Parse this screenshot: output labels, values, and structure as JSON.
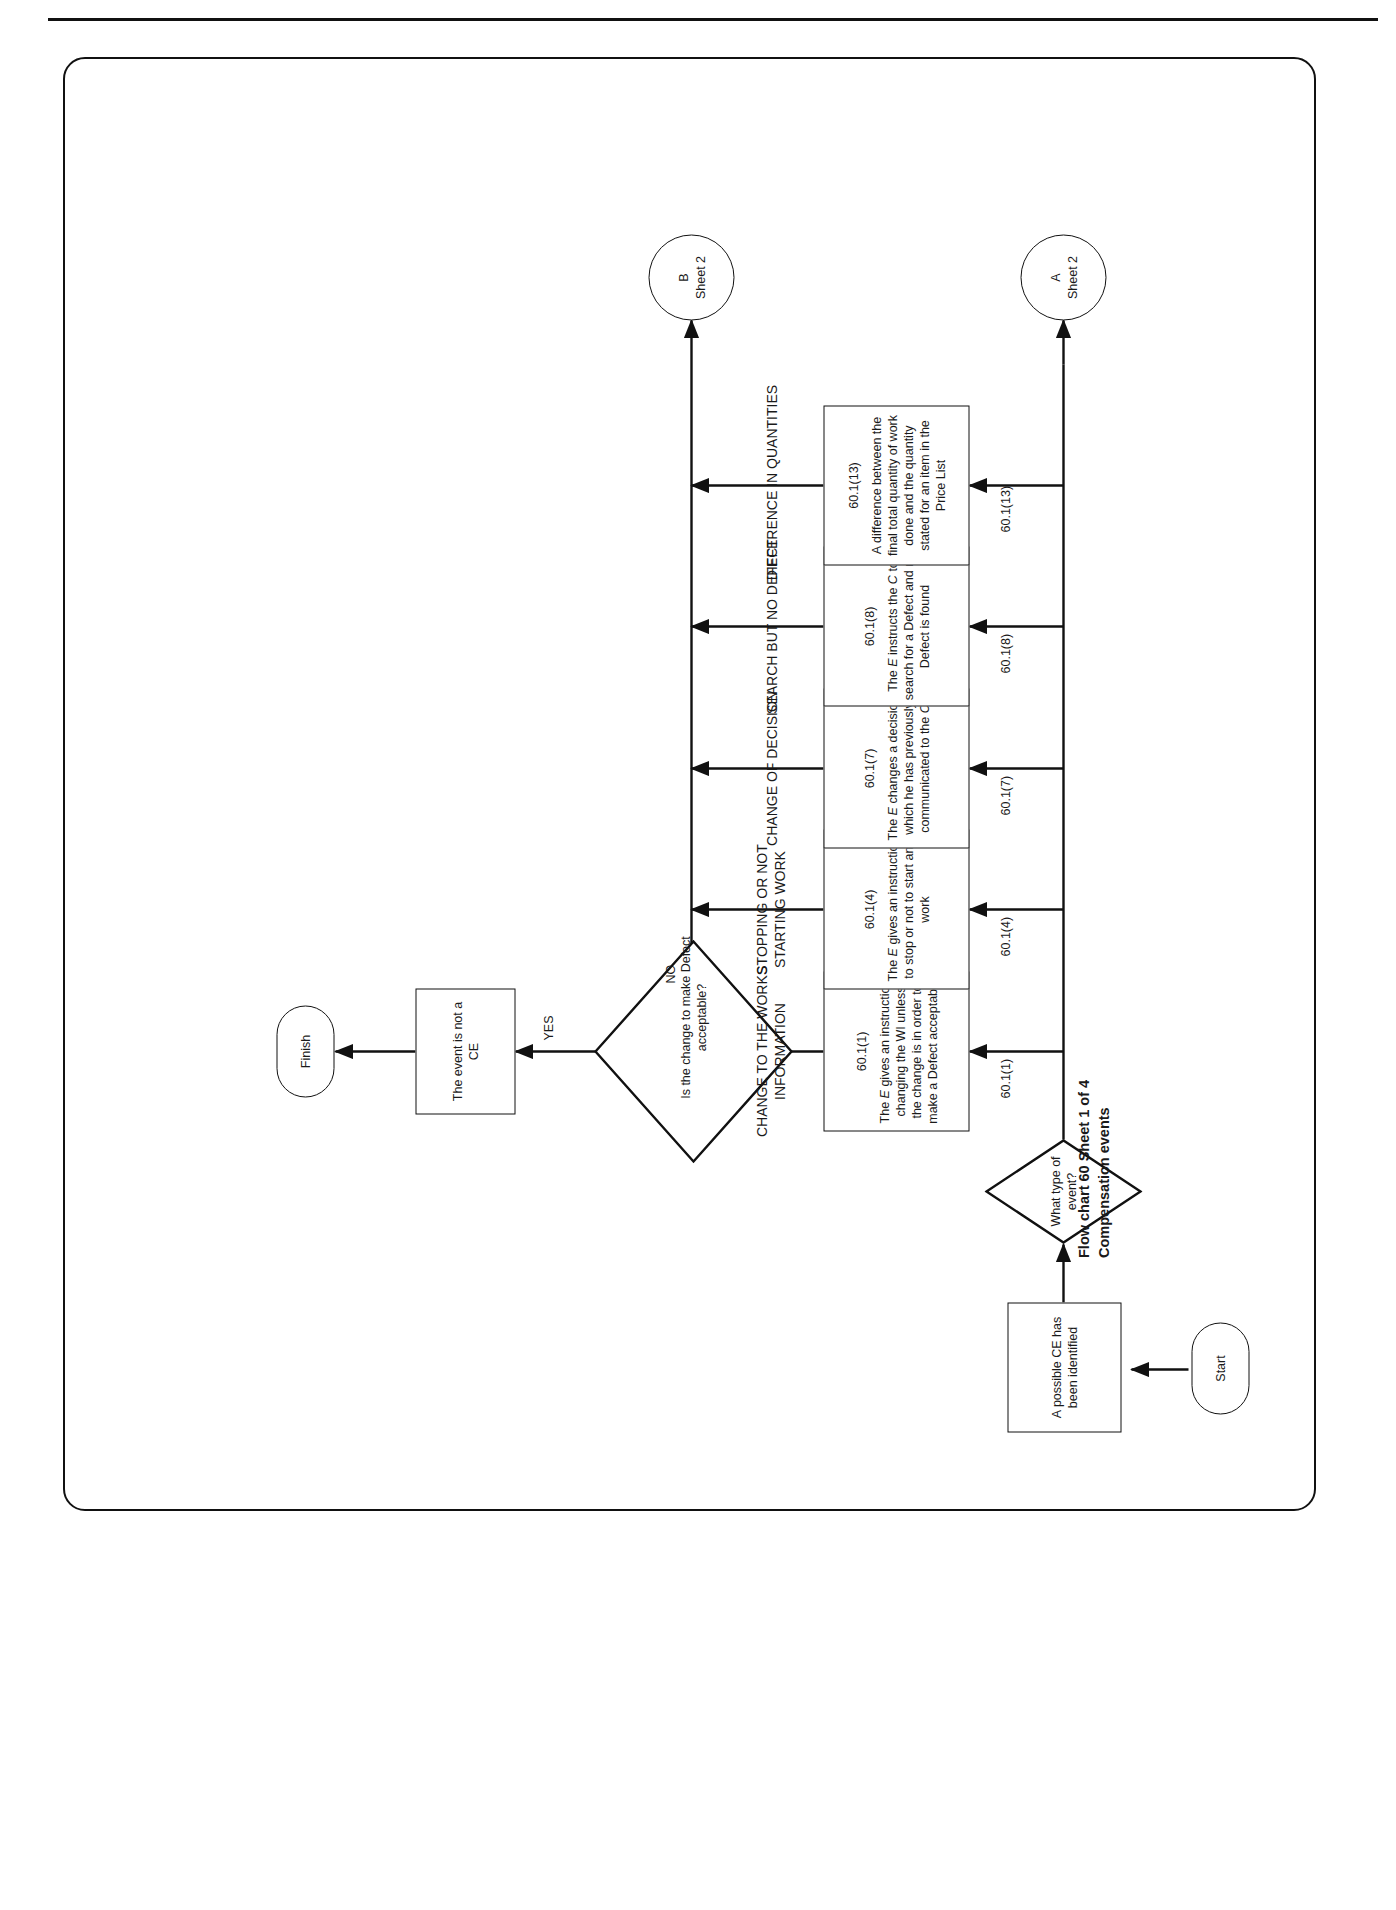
{
  "caption": "Flow chart 60 Sheet 1 of 4\nCompensation events",
  "nodes": {
    "start": "Start",
    "possible_ce": "A possible CE has been identified",
    "what_type": "What type of event?",
    "is_defect_acceptable": "Is the change to make Defect acceptable?",
    "event_not_ce": "The event is not a CE",
    "finish": "Finish"
  },
  "connectors": {
    "a": {
      "letter": "A",
      "sheet": "Sheet 2"
    },
    "b": {
      "letter": "B",
      "sheet": "Sheet 2"
    }
  },
  "edge_labels": {
    "yes": "YES",
    "no": "NO",
    "c1": "60.1(1)",
    "c4": "60.1(4)",
    "c7": "60.1(7)",
    "c8": "60.1(8)",
    "c13": "60.1(13)"
  },
  "branches": [
    {
      "heading": "CHANGE TO THE WORKS\nINFORMATION",
      "clause": "60.1(1)",
      "body_html": "The <i>E</i> gives an instruction changing the WI unless the change is in order to make a Defect acceptable",
      "body_text": "The E gives an instruction changing the WI unless the change is in order to make a Defect acceptable"
    },
    {
      "heading": "STOPPING OR NOT\nSTARTING WORK",
      "clause": "60.1(4)",
      "body_html": "The <i>E</i> gives an instruction to stop or not to start any work",
      "body_text": "The E gives an instruction to stop or not to start any work"
    },
    {
      "heading": "CHANGE OF DECISION",
      "clause": "60.1(7)",
      "body_html": "The <i>E</i> changes a decision which he has previously communicated to the <i>C</i>",
      "body_text": "The E changes a decision which he has previously communicated to the C"
    },
    {
      "heading": "SEARCH BUT NO DEFECT",
      "clause": "60.1(8)",
      "body_html": "The <i>E</i> instructs the <i>C</i> to search for a Defect and no Defect is found",
      "body_text": "The E instructs the C to search for a Defect and no Defect is found"
    },
    {
      "heading": "DIFFERENCE IN QUANTITIES",
      "clause": "60.1(13)",
      "body_html": "A difference between the final total quantity of work done and the quantity stated for an item in the Price List",
      "body_text": "A difference between the final total quantity of work done and the quantity stated for an item in the Price List"
    }
  ],
  "colors": {
    "line": "#111111",
    "background": "#ffffff"
  }
}
